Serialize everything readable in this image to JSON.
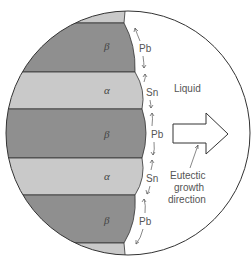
{
  "diagram": {
    "type": "eutectic-lamellar-growth",
    "layers": [
      {
        "phase": "β",
        "element": "Pb"
      },
      {
        "phase": "α",
        "element": "Sn"
      },
      {
        "phase": "β",
        "element": "Pb"
      },
      {
        "phase": "α",
        "element": "Sn"
      },
      {
        "phase": "β",
        "element": "Pb"
      }
    ],
    "liquid_label": "Liquid",
    "growth_label_lines": [
      "Eutectic",
      "growth",
      "direction"
    ],
    "colors": {
      "beta": "#8f8f8f",
      "alpha": "#c9c9c9",
      "outline": "#333333",
      "text": "#555555"
    }
  }
}
